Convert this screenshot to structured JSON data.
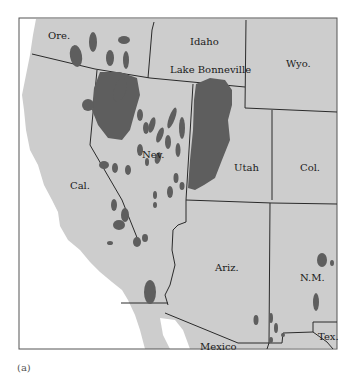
{
  "figure": {
    "caption": "(a)",
    "colors": {
      "land": "#cdcdcd",
      "ocean": "#ffffff",
      "lake_deposits": "#5e5e5e",
      "border": "#2a2a2a"
    }
  },
  "labels": {
    "ore": "Ore.",
    "idaho": "Idaho",
    "lake_bonneville": "Lake Bonneville",
    "wyo": "Wyo.",
    "nev": "Nev.",
    "utah": "Utah",
    "col": "Col.",
    "cal": "Cal.",
    "ariz": "Ariz.",
    "nm": "N.M.",
    "tex": "Tex.",
    "mexico": "Mexico"
  }
}
